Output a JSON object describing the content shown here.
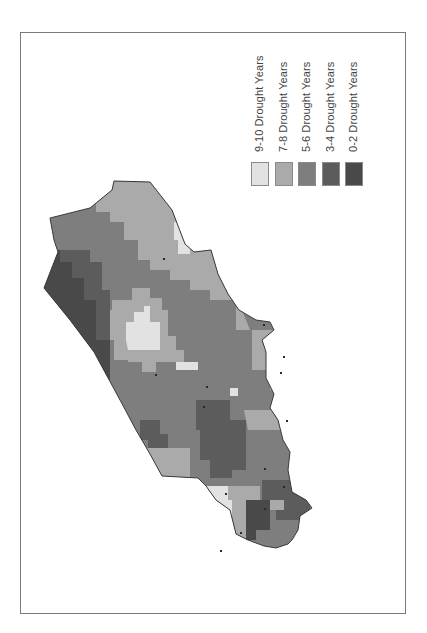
{
  "figure": {
    "type": "choropleth-map",
    "orientation": "rotated-90"
  },
  "legend": {
    "items": [
      {
        "label": "9-10 Drought Years",
        "color": "#e2e2e2"
      },
      {
        "label": "7-8 Drought Years",
        "color": "#aaaaaa"
      },
      {
        "label": "5-6 Drought Years",
        "color": "#7e7e7e"
      },
      {
        "label": "3-4 Drought Years",
        "color": "#5c5c5c"
      },
      {
        "label": "0-2 Drought Years",
        "color": "#494949"
      }
    ]
  },
  "map": {
    "outline_color": "#3a3a3a",
    "station_marker_color": "#2a2a2a"
  }
}
